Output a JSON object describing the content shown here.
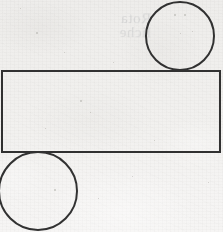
{
  "figure": {
    "medium": "scanned paper, black ink line art",
    "canvas": {
      "width": 223,
      "height": 232
    },
    "ink_color": "#2b2b2b",
    "paper_color": "#f1f0ee",
    "shapes": [
      {
        "name": "rectangle",
        "type": "rectangle",
        "x": 2,
        "y": 71,
        "width": 218,
        "height": 81,
        "stroke_width": 2,
        "fill": "none"
      },
      {
        "name": "circle-upper-right",
        "type": "circle",
        "cx": 180,
        "cy": 36,
        "r": 34,
        "stroke_width": 2,
        "fill": "none",
        "clipped_edges": "top"
      },
      {
        "name": "circle-lower-left",
        "type": "circle",
        "cx": 38,
        "cy": 191,
        "r": 39,
        "stroke_width": 2,
        "fill": "none",
        "clipped_edges": "left"
      }
    ],
    "ghost_text": "illegible"
  },
  "specks": [
    {
      "x": 36,
      "y": 32,
      "size": 2
    },
    {
      "x": 80,
      "y": 100,
      "size": 2
    },
    {
      "x": 174,
      "y": 14,
      "size": 2
    },
    {
      "x": 184,
      "y": 14,
      "size": 2
    },
    {
      "x": 192,
      "y": 31,
      "size": 1
    },
    {
      "x": 180,
      "y": 33,
      "size": 1
    },
    {
      "x": 90,
      "y": 112,
      "size": 1
    },
    {
      "x": 154,
      "y": 140,
      "size": 1
    },
    {
      "x": 54,
      "y": 189,
      "size": 2
    },
    {
      "x": 98,
      "y": 198,
      "size": 1
    },
    {
      "x": 20,
      "y": 8,
      "size": 1
    },
    {
      "x": 113,
      "y": 62,
      "size": 1
    },
    {
      "x": 208,
      "y": 182,
      "size": 1
    },
    {
      "x": 132,
      "y": 176,
      "size": 1
    },
    {
      "x": 64,
      "y": 52,
      "size": 1
    },
    {
      "x": 45,
      "y": 128,
      "size": 1
    }
  ]
}
